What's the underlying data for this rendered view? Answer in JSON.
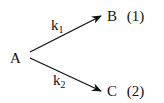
{
  "diagram": {
    "type": "parallel-reaction",
    "reactant": "A",
    "products": [
      {
        "species": "B",
        "tag": "(1)",
        "rate_constant": "k",
        "sub": "1"
      },
      {
        "species": "C",
        "tag": "(2)",
        "rate_constant": "k",
        "sub": "2"
      }
    ],
    "colors": {
      "ink": "#111111",
      "background": "#ffffff"
    }
  }
}
